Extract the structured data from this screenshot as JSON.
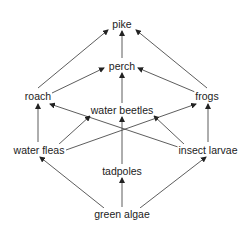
{
  "diagram": {
    "type": "food-web",
    "colors": {
      "line": "#333333",
      "text": "#222222",
      "background": "#ffffff"
    },
    "nodes": [
      {
        "id": "pike",
        "label": "pike",
        "x": 122,
        "y": 24
      },
      {
        "id": "perch",
        "label": "perch",
        "x": 122,
        "y": 66
      },
      {
        "id": "roach",
        "label": "roach",
        "x": 38,
        "y": 96
      },
      {
        "id": "frogs",
        "label": "frogs",
        "x": 207,
        "y": 96
      },
      {
        "id": "water_beetles",
        "label": "water beetles",
        "x": 122,
        "y": 110
      },
      {
        "id": "water_fleas",
        "label": "water fleas",
        "x": 39,
        "y": 150
      },
      {
        "id": "insect_larvae",
        "label": "insect larvae",
        "x": 208,
        "y": 150
      },
      {
        "id": "tadpoles",
        "label": "tadpoles",
        "x": 122,
        "y": 171
      },
      {
        "id": "green_algae",
        "label": "green algae",
        "x": 122,
        "y": 214
      }
    ],
    "edges": [
      {
        "from": "roach",
        "to": "pike",
        "x1": 38,
        "y1": 88,
        "x2": 108,
        "y2": 30
      },
      {
        "from": "perch",
        "to": "pike",
        "x1": 122,
        "y1": 58,
        "x2": 122,
        "y2": 31
      },
      {
        "from": "frogs",
        "to": "pike",
        "x1": 207,
        "y1": 88,
        "x2": 136,
        "y2": 30
      },
      {
        "from": "roach",
        "to": "perch",
        "x1": 52,
        "y1": 93,
        "x2": 104,
        "y2": 68
      },
      {
        "from": "water_beetles",
        "to": "perch",
        "x1": 122,
        "y1": 103,
        "x2": 122,
        "y2": 73
      },
      {
        "from": "frogs",
        "to": "perch",
        "x1": 195,
        "y1": 92,
        "x2": 138,
        "y2": 68
      },
      {
        "from": "water_fleas",
        "to": "roach",
        "x1": 38,
        "y1": 142,
        "x2": 38,
        "y2": 104
      },
      {
        "from": "insect_larvae",
        "to": "roach",
        "x1": 184,
        "y1": 149,
        "x2": 50,
        "y2": 104
      },
      {
        "from": "water_fleas",
        "to": "water_beetles",
        "x1": 58,
        "y1": 145,
        "x2": 90,
        "y2": 116
      },
      {
        "from": "insect_larvae",
        "to": "water_beetles",
        "x1": 185,
        "y1": 145,
        "x2": 154,
        "y2": 116
      },
      {
        "from": "water_fleas",
        "to": "frogs",
        "x1": 66,
        "y1": 150,
        "x2": 196,
        "y2": 104
      },
      {
        "from": "insect_larvae",
        "to": "frogs",
        "x1": 208,
        "y1": 142,
        "x2": 208,
        "y2": 104
      },
      {
        "from": "tadpoles",
        "to": "water_beetles",
        "x1": 122,
        "y1": 164,
        "x2": 122,
        "y2": 117
      },
      {
        "from": "green_algae",
        "to": "water_fleas",
        "x1": 104,
        "y1": 208,
        "x2": 40,
        "y2": 157
      },
      {
        "from": "green_algae",
        "to": "tadpoles",
        "x1": 122,
        "y1": 207,
        "x2": 122,
        "y2": 178
      },
      {
        "from": "green_algae",
        "to": "insect_larvae",
        "x1": 140,
        "y1": 208,
        "x2": 206,
        "y2": 157
      }
    ]
  }
}
